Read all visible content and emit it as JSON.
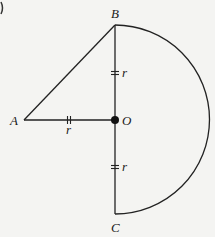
{
  "diagram": {
    "points": {
      "A": {
        "label": "A",
        "x": 24,
        "y": 120
      },
      "B": {
        "label": "B",
        "x": 115,
        "y": 25
      },
      "O": {
        "label": "O",
        "x": 115,
        "y": 120
      },
      "C": {
        "label": "C",
        "x": 115,
        "y": 214
      }
    },
    "segments": [
      {
        "from": "A",
        "to": "B"
      },
      {
        "from": "A",
        "to": "O",
        "marked_equal": true,
        "label": "r"
      },
      {
        "from": "B",
        "to": "O",
        "marked_equal": true,
        "label": "r"
      },
      {
        "from": "O",
        "to": "C",
        "marked_equal": true,
        "label": "r"
      }
    ],
    "arc": {
      "center": "O",
      "radius_label": "r",
      "from": "B",
      "to": "C",
      "side": "right",
      "type": "semicircle"
    },
    "labels": {
      "A": "A",
      "B": "B",
      "O": "O",
      "C": "C",
      "r_AO": "r",
      "r_BO": "r",
      "r_OC": "r"
    },
    "colors": {
      "stroke": "#222222",
      "background": "#f4f4f2"
    }
  }
}
